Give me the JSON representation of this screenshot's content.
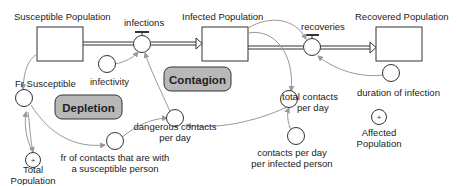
{
  "stocks": {
    "susceptible": {
      "label": "Susceptible Population"
    },
    "infected": {
      "label": "Infected Population"
    },
    "recovered": {
      "label": "Recovered Population"
    }
  },
  "flows": {
    "infections": {
      "label": "infections"
    },
    "recoveries": {
      "label": "recoveries"
    }
  },
  "auxiliaries": {
    "fr_susceptible": {
      "label": "Fr Susceptible"
    },
    "infectivity": {
      "label": "infectivity"
    },
    "total_population": {
      "label_line1": "Total",
      "label_line2": "Population",
      "symbol": "+"
    },
    "fr_contacts": {
      "label_line1": "fr of contacts that are with",
      "label_line2": "a susceptible person"
    },
    "dangerous_contacts": {
      "label_line1": "dangerous contacts",
      "label_line2": "per day"
    },
    "total_contacts": {
      "label_line1": "total contacts",
      "label_line2": "per day"
    },
    "contacts_per_infected": {
      "label_line1": "contacts per day",
      "label_line2": "per infected person"
    },
    "duration": {
      "label": "duration of infection"
    },
    "affected_population": {
      "label_line1": "Affected",
      "label_line2": "Population",
      "symbol": "+"
    }
  },
  "loops": {
    "depletion": {
      "label": "Depletion"
    },
    "contagion": {
      "label": "Contagion"
    }
  },
  "colors": {
    "line": "#333333",
    "link": "#999999",
    "loop_fill": "#b8b8b8"
  }
}
